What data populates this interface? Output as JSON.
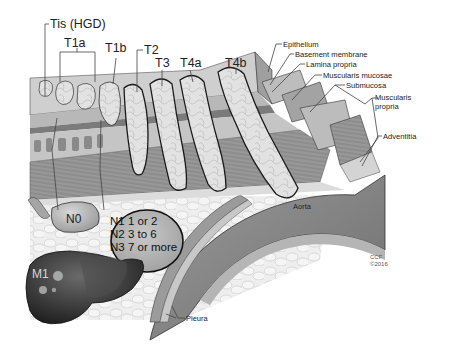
{
  "diagram": {
    "t_stages": [
      {
        "id": "tis",
        "label": "Tis (HGD)"
      },
      {
        "id": "t1a",
        "label": "T1a"
      },
      {
        "id": "t1b",
        "label": "T1b"
      },
      {
        "id": "t2",
        "label": "T2"
      },
      {
        "id": "t3",
        "label": "T3"
      },
      {
        "id": "t4a",
        "label": "T4a"
      },
      {
        "id": "t4b",
        "label": "T4b"
      }
    ],
    "layers": [
      {
        "id": "epithelium",
        "label": "Epithelium"
      },
      {
        "id": "basement-membrane",
        "label": "Basement membrane"
      },
      {
        "id": "lamina-propria",
        "label": "Lamina propria"
      },
      {
        "id": "muscularis-mucosae",
        "label": "Muscularis mucosae"
      },
      {
        "id": "submucosa",
        "label": "Submucosa"
      },
      {
        "id": "muscularis-propria",
        "label_line1": "Muscularis",
        "label_line2": "propria"
      },
      {
        "id": "adventitia",
        "label": "Adventitia"
      }
    ],
    "nodes": {
      "n0": "N0",
      "n_lines": [
        "N1 1 or 2",
        "N2 3 to 6",
        "N3 7 or more"
      ]
    },
    "metastasis": {
      "m1": "M1"
    },
    "structures": {
      "aorta": "Aorta",
      "pleura": "Pleura"
    },
    "credit": {
      "line1": "CCF",
      "line2": "©2016"
    },
    "colors": {
      "tissue_light": "#d9d9d9",
      "tissue_mid": "#a8a8a8",
      "tissue_dark": "#7a7a7a",
      "liver": "#3a3a3a",
      "aorta": "#8f8f8f",
      "fat": "#ececec",
      "outline": "#1a1a1a"
    }
  }
}
